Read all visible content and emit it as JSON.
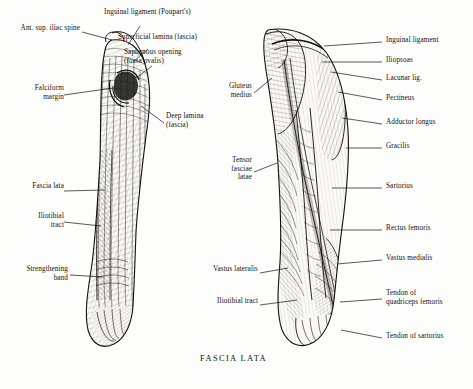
{
  "plate": {
    "caption": "FASCIA LATA",
    "left_figure": {
      "name": "left-thigh-fascia-figure",
      "labels": [
        {
          "id": "ant-sup-iliac-spine",
          "text": "Ant. sup. iliac spine",
          "align": "right",
          "x": 6,
          "y": 28,
          "w": 74,
          "leader": [
            {
              "x1": 82,
              "y1": 32,
              "x2": 112,
              "y2": 40
            }
          ]
        },
        {
          "id": "inguinal-ligament-poupart",
          "text": "Inguinal ligament (Poupart's)",
          "align": "left",
          "x": 104,
          "y": 12,
          "w": 122,
          "leader": [
            {
              "x1": 140,
              "y1": 22,
              "x2": 128,
              "y2": 45
            }
          ]
        },
        {
          "id": "superficial-lamina-fascia",
          "text": "Superficial lamina (fascia)",
          "align": "left",
          "x": 118,
          "y": 38,
          "w": 108,
          "leader": [
            {
              "x1": 148,
              "y1": 47,
              "x2": 132,
              "y2": 62
            }
          ]
        },
        {
          "id": "saphenous-opening-fossa-ovalis",
          "text": "Saphenous opening\n(fossa ovalis)",
          "align": "left",
          "x": 124,
          "y": 52,
          "w": 104,
          "leader": [
            {
              "x1": 152,
              "y1": 62,
              "x2": 135,
              "y2": 78
            }
          ]
        },
        {
          "id": "falciform-margin",
          "text": "Falciform\nmargin",
          "align": "right",
          "x": 8,
          "y": 88,
          "w": 54,
          "leader": [
            {
              "x1": 64,
              "y1": 93,
              "x2": 116,
              "y2": 88
            }
          ]
        },
        {
          "id": "deep-lamina-fascia",
          "text": "Deep lamina\n(fascia)",
          "align": "left",
          "x": 166,
          "y": 116,
          "w": 62,
          "leader": [
            {
              "x1": 164,
              "y1": 121,
              "x2": 140,
              "y2": 104
            }
          ]
        },
        {
          "id": "fascia-lata-left",
          "text": "Fascia lata",
          "align": "right",
          "x": 8,
          "y": 186,
          "w": 54,
          "leader": [
            {
              "x1": 64,
              "y1": 190,
              "x2": 104,
              "y2": 190
            }
          ]
        },
        {
          "id": "iliotibial-tract-left",
          "text": "Iliotibial\ntract",
          "align": "right",
          "x": 8,
          "y": 216,
          "w": 54,
          "leader": [
            {
              "x1": 64,
              "y1": 221,
              "x2": 102,
              "y2": 224
            }
          ]
        },
        {
          "id": "strengthening-band",
          "text": "Strengthening\nband",
          "align": "right",
          "x": 8,
          "y": 268,
          "w": 58,
          "leader": [
            {
              "x1": 68,
              "y1": 273,
              "x2": 104,
              "y2": 276
            }
          ]
        }
      ]
    },
    "right_figure": {
      "name": "right-thigh-muscles-figure",
      "labels": [
        {
          "id": "inguinal-ligament-right",
          "text": "Inguinal ligament",
          "align": "left",
          "x": 384,
          "y": 36,
          "w": 82,
          "leader": [
            {
              "x1": 382,
              "y1": 40,
              "x2": 324,
              "y2": 44
            }
          ]
        },
        {
          "id": "iliopsoas",
          "text": "Iliopsoas",
          "align": "left",
          "x": 384,
          "y": 56,
          "w": 82,
          "leader": [
            {
              "x1": 382,
              "y1": 60,
              "x2": 322,
              "y2": 62
            }
          ]
        },
        {
          "id": "lacunar-lig",
          "text": "Lacunar lig.",
          "align": "left",
          "x": 384,
          "y": 74,
          "w": 82,
          "leader": [
            {
              "x1": 382,
              "y1": 78,
              "x2": 330,
              "y2": 74
            }
          ]
        },
        {
          "id": "pectineus",
          "text": "Pectineus",
          "align": "left",
          "x": 384,
          "y": 94,
          "w": 82,
          "leader": [
            {
              "x1": 382,
              "y1": 98,
              "x2": 336,
              "y2": 92
            }
          ]
        },
        {
          "id": "adductor-longus",
          "text": "Adductor longus",
          "align": "left",
          "x": 384,
          "y": 118,
          "w": 82,
          "leader": [
            {
              "x1": 382,
              "y1": 122,
              "x2": 340,
              "y2": 118
            }
          ]
        },
        {
          "id": "gracilis",
          "text": "Gracilis",
          "align": "left",
          "x": 384,
          "y": 142,
          "w": 82,
          "leader": [
            {
              "x1": 382,
              "y1": 146,
              "x2": 346,
              "y2": 146
            }
          ]
        },
        {
          "id": "sartorius",
          "text": "Sartorius",
          "align": "left",
          "x": 384,
          "y": 182,
          "w": 82,
          "leader": [
            {
              "x1": 382,
              "y1": 186,
              "x2": 332,
              "y2": 186
            }
          ]
        },
        {
          "id": "rectus-femoris",
          "text": "Rectus femoris",
          "align": "left",
          "x": 384,
          "y": 224,
          "w": 82,
          "leader": [
            {
              "x1": 382,
              "y1": 228,
              "x2": 330,
              "y2": 228
            }
          ]
        },
        {
          "id": "vastus-medialis",
          "text": "Vastus medialis",
          "align": "left",
          "x": 384,
          "y": 254,
          "w": 82,
          "leader": [
            {
              "x1": 382,
              "y1": 258,
              "x2": 336,
              "y2": 262
            }
          ]
        },
        {
          "id": "tendon-of-quadriceps-femoris",
          "text": "Tendon of\nquadriceps femoris",
          "align": "left",
          "x": 384,
          "y": 292,
          "w": 88,
          "leader": [
            {
              "x1": 382,
              "y1": 297,
              "x2": 340,
              "y2": 300
            }
          ]
        },
        {
          "id": "tendon-of-sartorius",
          "text": "Tendon of sartorius",
          "align": "left",
          "x": 384,
          "y": 332,
          "w": 88,
          "leader": [
            {
              "x1": 382,
              "y1": 336,
              "x2": 342,
              "y2": 330
            }
          ]
        },
        {
          "id": "gluteus-medius",
          "text": "Gluteus\nmedius",
          "align": "right",
          "x": 204,
          "y": 86,
          "w": 48,
          "leader": [
            {
              "x1": 254,
              "y1": 91,
              "x2": 272,
              "y2": 76
            }
          ]
        },
        {
          "id": "tensor-fasciae-latae",
          "text": "Tensor\nfasciae\nlatae",
          "align": "right",
          "x": 204,
          "y": 160,
          "w": 48,
          "leader": [
            {
              "x1": 254,
              "y1": 170,
              "x2": 276,
              "y2": 162
            }
          ]
        },
        {
          "id": "vastus-lateralis",
          "text": "Vastus lateralis",
          "align": "right",
          "x": 196,
          "y": 268,
          "w": 62,
          "leader": [
            {
              "x1": 260,
              "y1": 272,
              "x2": 288,
              "y2": 268
            }
          ]
        },
        {
          "id": "iliotibial-tract-right",
          "text": "Iliotibial tract",
          "align": "right",
          "x": 198,
          "y": 300,
          "w": 60,
          "leader": [
            {
              "x1": 260,
              "y1": 304,
              "x2": 296,
              "y2": 300
            }
          ]
        }
      ]
    }
  }
}
